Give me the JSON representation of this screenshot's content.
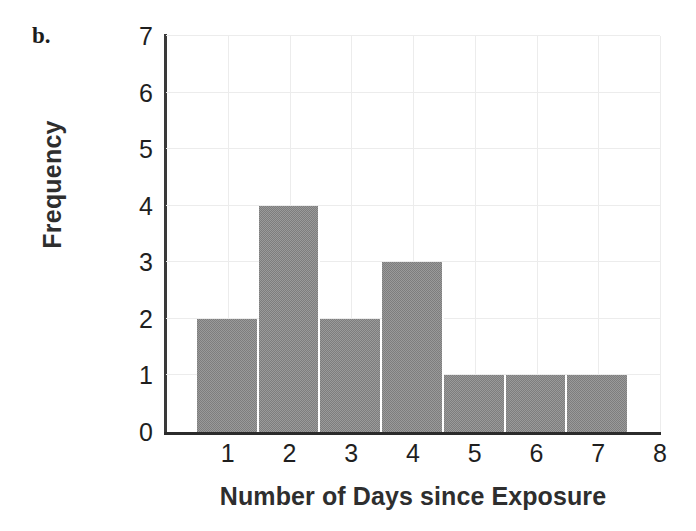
{
  "figure": {
    "panel_label": "b."
  },
  "chart_data": {
    "type": "bar",
    "title": "",
    "subtitle": "",
    "xlabel": "Number of Days since Exposure",
    "ylabel": "Frequency",
    "categories": [
      "1",
      "2",
      "3",
      "4",
      "5",
      "6",
      "7"
    ],
    "values": [
      2,
      4,
      2,
      3,
      1,
      1,
      1
    ],
    "bin_edges": [
      0.5,
      1.5,
      2.5,
      3.5,
      4.5,
      5.5,
      6.5,
      7.5
    ],
    "bin_width": 1,
    "xlim": [
      0,
      8
    ],
    "ylim": [
      0,
      7
    ],
    "xticks": [
      "1",
      "2",
      "3",
      "4",
      "5",
      "6",
      "7",
      "8"
    ],
    "xtick_values": [
      1,
      2,
      3,
      4,
      5,
      6,
      7,
      8
    ],
    "yticks": [
      "0",
      "1",
      "2",
      "3",
      "4",
      "5",
      "6",
      "7"
    ],
    "ytick_values": [
      0,
      1,
      2,
      3,
      4,
      5,
      6,
      7
    ],
    "grid": true,
    "legend": null,
    "bar_color": "#7d7d7d",
    "bar_separator_color": "#ffffff",
    "grid_color": "#ececec",
    "axis_color": "#2b2b2b",
    "text_color": "#1f1f1f"
  }
}
